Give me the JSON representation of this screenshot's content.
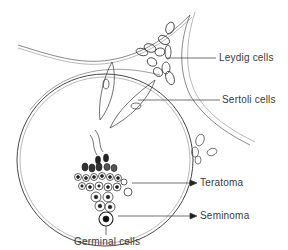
{
  "diagram": {
    "type": "anatomical-illustration",
    "labels": {
      "leydig": "Leydig cells",
      "sertoli": "Sertoli cells",
      "teratoma": "Teratoma",
      "seminoma": "Seminoma",
      "germinal": "Germinal cells"
    },
    "colors": {
      "line": "#2a2a2a",
      "faint_line": "#9a9a9a",
      "text": "#3a3a3a",
      "background": "#ffffff"
    }
  }
}
